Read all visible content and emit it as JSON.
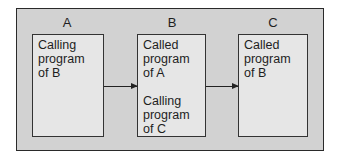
{
  "diagram": {
    "modules": [
      {
        "label": "A",
        "lines": [
          "Calling",
          "program",
          "of B"
        ]
      },
      {
        "label": "B",
        "lines": [
          "Called",
          "program",
          "of A"
        ],
        "lines2": [
          "Calling",
          "program",
          "of C"
        ]
      },
      {
        "label": "C",
        "lines": [
          "Called",
          "program",
          "of B"
        ]
      }
    ],
    "arrows": [
      {
        "from": "A",
        "to": "B"
      },
      {
        "from": "B",
        "to": "C"
      }
    ]
  }
}
